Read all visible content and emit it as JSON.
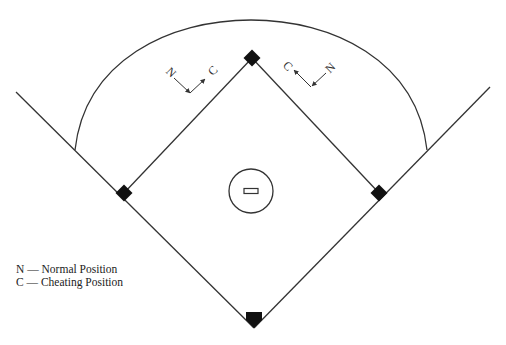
{
  "diagram": {
    "type": "baseball-field",
    "colors": {
      "line": "#333333",
      "base": "#111111",
      "background": "#ffffff"
    },
    "elements": {
      "home_plate": "home-plate",
      "first_base": "first-base",
      "second_base": "second-base",
      "third_base": "third-base",
      "pitchers_mound": "pitchers-mound",
      "pitchers_rubber": "pitchers-rubber",
      "outfield_arc": "outfield-fence-arc",
      "foul_lines": [
        "left-foul-line",
        "right-foul-line"
      ]
    }
  },
  "markers": {
    "left": {
      "normal_label": "N",
      "cheating_label": "C"
    },
    "right": {
      "normal_label": "N",
      "cheating_label": "C"
    }
  },
  "legend": {
    "items": [
      {
        "key": "N",
        "text": "N — Normal Position"
      },
      {
        "key": "C",
        "text": "C — Cheating Position"
      }
    ]
  }
}
